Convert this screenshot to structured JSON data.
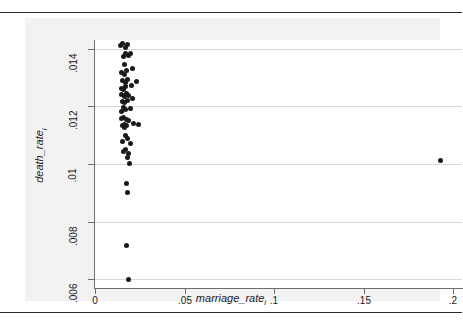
{
  "figure": {
    "background": "#f2f2f2",
    "plot_background": "#ffffff",
    "marker_color": "#1a1a1a",
    "grid_color": "#d8d8d8",
    "axis_color": "#6e6e6e"
  },
  "axes": {
    "x_title_main": "marriage_rate",
    "x_title_sub": "i",
    "y_title_main": "death_rate",
    "y_title_sub": "i"
  },
  "chart_data": {
    "type": "scatter",
    "title": "",
    "xlabel": "marriage_rate_i",
    "ylabel": "death_rate_i",
    "xlim": [
      0,
      0.205
    ],
    "ylim": [
      0.0057,
      0.0143
    ],
    "xticks": [
      0,
      0.05,
      0.1,
      0.15,
      0.2
    ],
    "xticklabels": [
      "0",
      ".05",
      ".1",
      ".15",
      ".2"
    ],
    "yticks": [
      0.006,
      0.008,
      0.01,
      0.012,
      0.014
    ],
    "yticklabels": [
      ".006",
      ".008",
      ".01",
      ".012",
      ".014"
    ],
    "grid": "horizontal",
    "legend": "none",
    "series": [
      {
        "name": "states",
        "marker": "filled-circle",
        "color": "#1a1a1a",
        "points": [
          [
            0.0143,
            0.01412
          ],
          [
            0.0155,
            0.01418
          ],
          [
            0.0168,
            0.01405
          ],
          [
            0.0181,
            0.01415
          ],
          [
            0.017,
            0.01385
          ],
          [
            0.0158,
            0.01372
          ],
          [
            0.0186,
            0.01378
          ],
          [
            0.0199,
            0.01382
          ],
          [
            0.0165,
            0.01345
          ],
          [
            0.0149,
            0.01318
          ],
          [
            0.0162,
            0.01312
          ],
          [
            0.0177,
            0.01325
          ],
          [
            0.021,
            0.01332
          ],
          [
            0.0152,
            0.01288
          ],
          [
            0.0168,
            0.01282
          ],
          [
            0.0184,
            0.01292
          ],
          [
            0.0146,
            0.01262
          ],
          [
            0.0159,
            0.01258
          ],
          [
            0.0172,
            0.01268
          ],
          [
            0.0203,
            0.01272
          ],
          [
            0.0232,
            0.01285
          ],
          [
            0.015,
            0.0124
          ],
          [
            0.0163,
            0.01235
          ],
          [
            0.0176,
            0.01245
          ],
          [
            0.0189,
            0.01238
          ],
          [
            0.0154,
            0.01218
          ],
          [
            0.0167,
            0.01212
          ],
          [
            0.018,
            0.01222
          ],
          [
            0.0208,
            0.01228
          ],
          [
            0.0157,
            0.01195
          ],
          [
            0.017,
            0.01188
          ],
          [
            0.0145,
            0.01182
          ],
          [
            0.0196,
            0.01192
          ],
          [
            0.016,
            0.01162
          ],
          [
            0.0173,
            0.01155
          ],
          [
            0.0149,
            0.01158
          ],
          [
            0.0186,
            0.0115
          ],
          [
            0.0162,
            0.01138
          ],
          [
            0.0175,
            0.01132
          ],
          [
            0.0151,
            0.01135
          ],
          [
            0.0164,
            0.01128
          ],
          [
            0.0212,
            0.01142
          ],
          [
            0.0242,
            0.01138
          ],
          [
            0.0168,
            0.01098
          ],
          [
            0.0182,
            0.01088
          ],
          [
            0.0155,
            0.01078
          ],
          [
            0.0196,
            0.01072
          ],
          [
            0.0172,
            0.01052
          ],
          [
            0.0159,
            0.01045
          ],
          [
            0.0188,
            0.01038
          ],
          [
            0.0179,
            0.01022
          ],
          [
            0.0192,
            0.01002
          ],
          [
            0.0176,
            0.00932
          ],
          [
            0.0184,
            0.00903
          ],
          [
            0.0175,
            0.00718
          ],
          [
            0.0187,
            0.00601
          ],
          [
            0.193,
            0.01012
          ]
        ]
      }
    ]
  }
}
